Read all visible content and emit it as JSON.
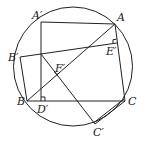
{
  "diagram": {
    "type": "geometry",
    "circle": {
      "cx": 73,
      "cy": 66.5,
      "r": 59.5
    },
    "points": {
      "A": {
        "x": 115,
        "y": 24
      },
      "A_prime": {
        "x": 41,
        "y": 22
      },
      "B": {
        "x": 27,
        "y": 101
      },
      "B_prime": {
        "x": 20,
        "y": 57
      },
      "C": {
        "x": 125,
        "y": 101
      },
      "C_prime": {
        "x": 95,
        "y": 124
      },
      "D_prime": {
        "x": 41,
        "y": 101
      },
      "E_prime": {
        "x": 117,
        "y": 43
      },
      "F_prime": {
        "x": 57,
        "y": 75
      },
      "P": {
        "x": 41,
        "y": 54
      }
    },
    "labels": {
      "A": "A",
      "A_prime": "A′",
      "B": "B",
      "B_prime": "B′",
      "C": "C",
      "C_prime": "C′",
      "D_prime": "D′",
      "E_prime": "E′",
      "F_prime": "F′"
    },
    "segments": [
      [
        "A_prime",
        "A"
      ],
      [
        "A_prime",
        "D_prime"
      ],
      [
        "B_prime",
        "E_prime"
      ],
      [
        "B_prime",
        "B"
      ],
      [
        "B",
        "C"
      ],
      [
        "A",
        "C"
      ],
      [
        "B",
        "A"
      ],
      [
        "P",
        "C_prime"
      ],
      [
        "C",
        "C_prime"
      ]
    ],
    "right_angles": [
      "D_prime",
      "E_prime",
      "F_prime"
    ],
    "stroke_color": "#222222"
  }
}
